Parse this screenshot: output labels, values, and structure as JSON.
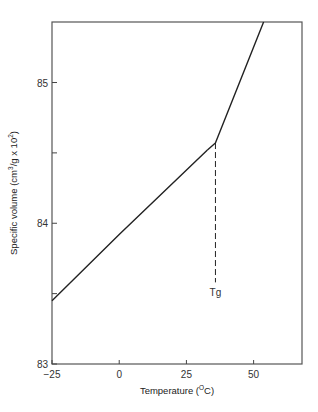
{
  "chart_data": {
    "type": "line",
    "title": "",
    "xlabel": "Temperature (°C)",
    "xlabel_parts": [
      "Temperature (",
      "O",
      "C)"
    ],
    "ylabel": "Specific volume (cm³/g x 10²)",
    "ylabel_parts": [
      "Specific volume (cm",
      "3",
      "/g x 10",
      "2",
      ")"
    ],
    "xlim": [
      -25,
      68
    ],
    "ylim": [
      83,
      85.43
    ],
    "x_ticks": [
      -25,
      0,
      25,
      50
    ],
    "x_tick_labels": [
      "−25",
      "0",
      "25",
      "50"
    ],
    "y_ticks": [
      83,
      84,
      85
    ],
    "y_tick_labels": [
      "83",
      "84",
      "85"
    ],
    "y_minor_ticks": [
      83.5,
      84.5
    ],
    "grid": false,
    "legend": null,
    "series": [
      {
        "name": "glassy region",
        "x": [
          -25,
          0,
          32.8
        ],
        "y": [
          83.45,
          83.92,
          84.52
        ]
      },
      {
        "name": "rubbery region",
        "x": [
          32.8,
          35.8,
          53.7
        ],
        "y": [
          84.52,
          84.57,
          85.43
        ]
      }
    ],
    "annotations": [
      {
        "type": "dashed-vertical-line",
        "label": "Tg",
        "x": 35.8,
        "y_from": 84.57,
        "y_to": 83.58
      }
    ]
  },
  "colors": {
    "line": "#222222",
    "axis": "#444444",
    "background": "#ffffff"
  }
}
